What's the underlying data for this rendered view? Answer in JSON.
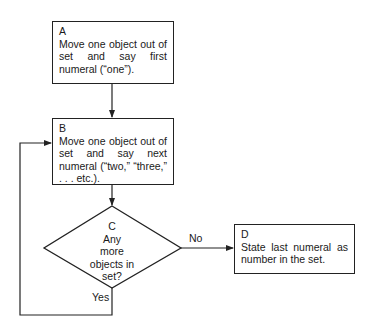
{
  "nodes": {
    "A": {
      "id": "A",
      "text": "Move one object out of set and say first numeral (“one”)."
    },
    "B": {
      "id": "B",
      "text": "Move one object out of set and say next numeral (“two,” “three,” . . . etc.)."
    },
    "C": {
      "id": "C",
      "line1": "Any",
      "line2": "more",
      "line3": "objects in",
      "line4": "set?"
    },
    "D": {
      "id": "D",
      "text": "State last numeral as number in the set."
    }
  },
  "edges": {
    "no_label": "No",
    "yes_label": "Yes"
  },
  "colors": {
    "line": "#222222",
    "background": "#ffffff"
  }
}
